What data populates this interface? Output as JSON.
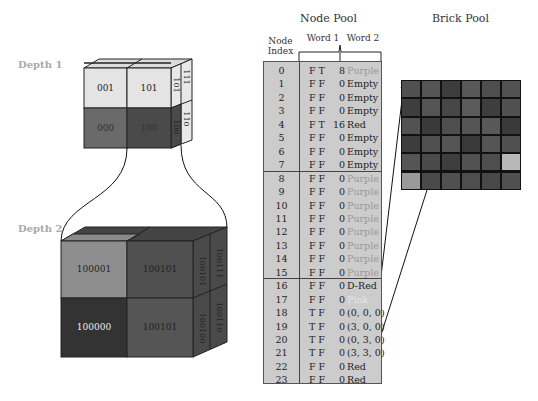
{
  "depth_labels": [
    "Depth 1",
    "Depth 2"
  ],
  "depth1_cube": {
    "front": [
      {
        "label": "001",
        "color": "#e4e4e4",
        "text_color": "#222"
      },
      {
        "label": "101",
        "color": "#e4e4e4",
        "text_color": "#222"
      },
      {
        "label": "000",
        "color": "#6a6a6a",
        "text_color": "#333"
      },
      {
        "label": "100",
        "color": "#4a4a4a",
        "text_color": "#333"
      }
    ],
    "side": [
      "101",
      "111",
      "100",
      "110"
    ]
  },
  "depth2_cube": {
    "front": [
      {
        "label": "100001",
        "color": "#8e8e8e",
        "text_color": "#222"
      },
      {
        "label": "100101",
        "color": "#505050",
        "text_color": "#222"
      },
      {
        "label": "100000",
        "color": "#333333",
        "text_color": "#eee"
      },
      {
        "label": "100101",
        "color": "#555555",
        "text_color": "#222"
      }
    ],
    "side": [
      "100101",
      "100111",
      "100100",
      "100110"
    ]
  },
  "node_pool": {
    "title": "Node Pool",
    "index_header": "Node Index",
    "word1_header": "Word 1",
    "word2_header": "Word 2",
    "rows": [
      {
        "index": "0",
        "flags": "F T",
        "ptr": "8",
        "value": "Purple",
        "color": "#999"
      },
      {
        "index": "1",
        "flags": "F F",
        "ptr": "0",
        "value": "Empty",
        "color": "#222"
      },
      {
        "index": "2",
        "flags": "F F",
        "ptr": "0",
        "value": "Empty",
        "color": "#222"
      },
      {
        "index": "3",
        "flags": "F F",
        "ptr": "0",
        "value": "Empty",
        "color": "#222"
      },
      {
        "index": "4",
        "flags": "F T",
        "ptr": "16",
        "value": "Red",
        "color": "#222"
      },
      {
        "index": "5",
        "flags": "F F",
        "ptr": "0",
        "value": "Empty",
        "color": "#222"
      },
      {
        "index": "6",
        "flags": "F F",
        "ptr": "0",
        "value": "Empty",
        "color": "#222"
      },
      {
        "index": "7",
        "flags": "F F",
        "ptr": "0",
        "value": "Empty",
        "color": "#222"
      },
      {
        "index": "8",
        "flags": "F F",
        "ptr": "0",
        "value": "Purple",
        "color": "#999"
      },
      {
        "index": "9",
        "flags": "F F",
        "ptr": "0",
        "value": "Purple",
        "color": "#999"
      },
      {
        "index": "10",
        "flags": "F F",
        "ptr": "0",
        "value": "Purple",
        "color": "#999"
      },
      {
        "index": "11",
        "flags": "F F",
        "ptr": "0",
        "value": "Purple",
        "color": "#999"
      },
      {
        "index": "12",
        "flags": "F F",
        "ptr": "0",
        "value": "Purple",
        "color": "#999"
      },
      {
        "index": "13",
        "flags": "F F",
        "ptr": "0",
        "value": "Purple",
        "color": "#999"
      },
      {
        "index": "14",
        "flags": "F F",
        "ptr": "0",
        "value": "Purple",
        "color": "#999"
      },
      {
        "index": "15",
        "flags": "F F",
        "ptr": "0",
        "value": "Purple",
        "color": "#999"
      },
      {
        "index": "16",
        "flags": "F F",
        "ptr": "0",
        "value": "D-Red",
        "color": "#222"
      },
      {
        "index": "17",
        "flags": "F F",
        "ptr": "0",
        "value": "Pink",
        "color": "#e6e6e6"
      },
      {
        "index": "18",
        "flags": "T F",
        "ptr": "0",
        "value": "(0, 0, 0)",
        "color": "#222"
      },
      {
        "index": "19",
        "flags": "T F",
        "ptr": "0",
        "value": "(3, 0, 0)",
        "color": "#222"
      },
      {
        "index": "20",
        "flags": "T F",
        "ptr": "0",
        "value": "(0, 3, 0)",
        "color": "#222"
      },
      {
        "index": "21",
        "flags": "T F",
        "ptr": "0",
        "value": "(3, 3, 0)",
        "color": "#222"
      },
      {
        "index": "22",
        "flags": "F F",
        "ptr": "0",
        "value": "Red",
        "color": "#222"
      },
      {
        "index": "23",
        "flags": "F F",
        "ptr": "0",
        "value": "Red",
        "color": "#222"
      }
    ]
  },
  "brick_pool": {
    "title": "Brick Pool",
    "grid": [
      [
        "#505050",
        "#555555",
        "#3c3c3c",
        "#585858",
        "#4e4e4e",
        "#525252"
      ],
      [
        "#3e3e3e",
        "#545454",
        "#474747",
        "#5a5a5a",
        "#3e3e3e",
        "#505050"
      ],
      [
        "#525252",
        "#3a3a3a",
        "#4e4e4e",
        "#545454",
        "#585858",
        "#3a3a3a"
      ],
      [
        "#3c3c3c",
        "#505050",
        "#555555",
        "#3a3a3a",
        "#545454",
        "#505050"
      ],
      [
        "#555555",
        "#4a4a4a",
        "#3e3e3e",
        "#525252",
        "#4e4e4e",
        "#b8b8b8"
      ],
      [
        "#9a9a9a",
        "#4a4a4a",
        "#505050",
        "#4e4e4e",
        "#484848",
        "#505050"
      ]
    ]
  }
}
